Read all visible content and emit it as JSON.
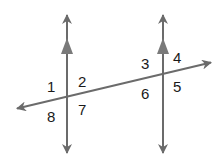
{
  "diagram": {
    "colors": {
      "line": "#6b6b6b",
      "label": "#1a1a1a",
      "background": "#ffffff"
    },
    "lines": {
      "left_parallel": {
        "x": 67,
        "y_top": 13,
        "y_bottom": 155,
        "parallel_marker": true
      },
      "right_parallel": {
        "x": 163,
        "y_top": 13,
        "y_bottom": 155,
        "parallel_marker": true
      },
      "transversal": {
        "x1": 15,
        "y1": 109,
        "x2": 213,
        "y2": 62
      }
    },
    "angle_labels": [
      {
        "id": "1",
        "text": "1",
        "x": 47,
        "y": 92
      },
      {
        "id": "2",
        "text": "2",
        "x": 78,
        "y": 87
      },
      {
        "id": "8",
        "text": "8",
        "x": 47,
        "y": 122
      },
      {
        "id": "7",
        "text": "7",
        "x": 78,
        "y": 115
      },
      {
        "id": "3",
        "text": "3",
        "x": 141,
        "y": 69
      },
      {
        "id": "4",
        "text": "4",
        "x": 173,
        "y": 63
      },
      {
        "id": "6",
        "text": "6",
        "x": 141,
        "y": 99
      },
      {
        "id": "5",
        "text": "5",
        "x": 173,
        "y": 92
      }
    ]
  }
}
